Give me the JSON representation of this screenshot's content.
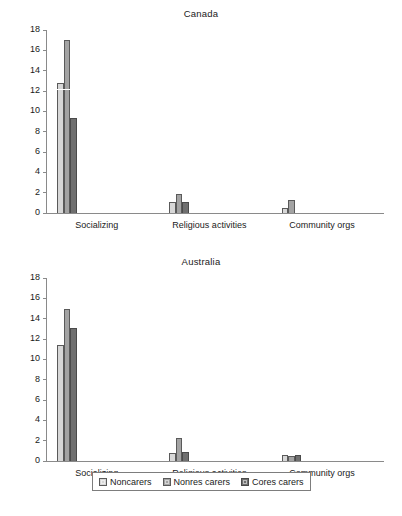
{
  "chart_data": [
    {
      "type": "bar",
      "title": "Canada",
      "xlabel": "",
      "ylabel": "",
      "ylim": [
        0,
        18
      ],
      "yticks": [
        0,
        2,
        4,
        6,
        8,
        10,
        12,
        14,
        16,
        18
      ],
      "grid": false,
      "legend_position": "bottom",
      "categories": [
        "Socializing",
        "Religious activities",
        "Community orgs"
      ],
      "series": [
        {
          "name": "Noncarers",
          "color": "#d7d7d7",
          "values": [
            12.8,
            1.1,
            0.5
          ]
        },
        {
          "name": "Nonres carers",
          "color": "#a3a3a3",
          "values": [
            17.0,
            1.9,
            1.3
          ]
        },
        {
          "name": "Cores carers",
          "color": "#6f6f6f",
          "values": [
            9.3,
            1.1,
            0.0
          ]
        }
      ],
      "annotations": [
        {
          "text": "white horizontal line across first Noncarers bar",
          "value": 12.1
        }
      ]
    },
    {
      "type": "bar",
      "title": "Australia",
      "xlabel": "",
      "ylabel": "",
      "ylim": [
        0,
        18
      ],
      "yticks": [
        0,
        2,
        4,
        6,
        8,
        10,
        12,
        14,
        16,
        18
      ],
      "grid": false,
      "legend_position": "bottom",
      "categories": [
        "Socializing",
        "Religious activities",
        "Community orgs"
      ],
      "series": [
        {
          "name": "Noncarers",
          "color": "#d7d7d7",
          "values": [
            11.4,
            0.8,
            0.6
          ]
        },
        {
          "name": "Nonres carers",
          "color": "#a3a3a3",
          "values": [
            15.0,
            2.3,
            0.5
          ]
        },
        {
          "name": "Cores carers",
          "color": "#6f6f6f",
          "values": [
            13.1,
            0.9,
            0.6
          ]
        }
      ]
    }
  ],
  "legend": {
    "items": [
      {
        "label": "Noncarers",
        "color": "#d7d7d7"
      },
      {
        "label": "Nonres carers",
        "color": "#a3a3a3"
      },
      {
        "label": "Cores carers",
        "color": "#6f6f6f"
      }
    ]
  },
  "axis": {
    "y_tick_labels": [
      "18",
      "16",
      "14",
      "12",
      "10",
      "8",
      "6",
      "4",
      "2",
      "0"
    ]
  },
  "titles": {
    "canada": "Canada",
    "australia": "Australia"
  },
  "categories": [
    "Socializing",
    "Religious activities",
    "Community orgs"
  ],
  "colors": {
    "series_light": "#d7d7d7",
    "series_medium": "#a3a3a3",
    "series_dark": "#6f6f6f",
    "axis": "#8a8a8a",
    "text": "#1a1a1a"
  }
}
